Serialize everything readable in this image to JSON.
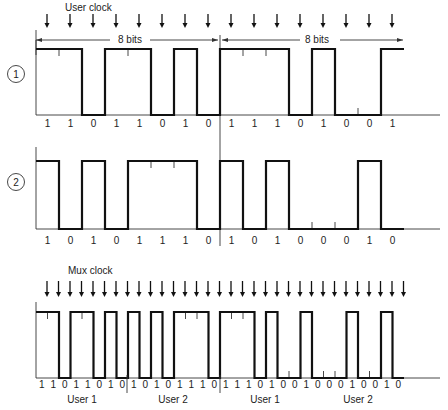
{
  "figure": {
    "user_clock_label": "User clock",
    "mux_clock_label": "Mux clock",
    "span_label_1": "8 bits",
    "span_label_2": "8 bits",
    "signal_1": {
      "marker": "1",
      "bits": "1101101011101001"
    },
    "signal_2": {
      "marker": "2",
      "bits": "1010111010100010"
    },
    "mux": {
      "bits": "11011010101011101110100100010010",
      "groups": [
        {
          "label": "User 1"
        },
        {
          "label": "User 2"
        },
        {
          "label": "User 1"
        },
        {
          "label": "User 2"
        }
      ]
    }
  }
}
